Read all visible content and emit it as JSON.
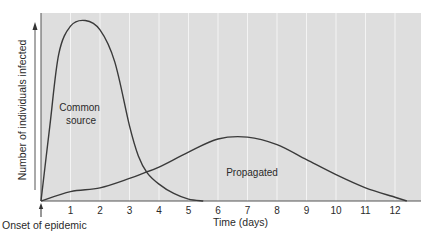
{
  "chart_data": {
    "type": "line",
    "title": "",
    "xlabel": "Time (days)",
    "ylabel": "Number of individuals infected",
    "x_ticks": [
      1,
      2,
      3,
      4,
      5,
      6,
      7,
      8,
      9,
      10,
      11,
      12
    ],
    "xlim": [
      0,
      13
    ],
    "ylim": [
      0,
      100
    ],
    "grid": "vertical",
    "origin_annotation": "Onset of epidemic",
    "series": [
      {
        "name": "Common source",
        "label_lines": [
          "Common",
          "source"
        ],
        "x": [
          0,
          0.3,
          0.6,
          1.0,
          1.5,
          2.0,
          2.5,
          3.0,
          3.3,
          3.6,
          4.0,
          4.5,
          5.0,
          5.5
        ],
        "values": [
          0,
          40,
          78,
          93,
          96,
          91,
          74,
          40,
          24,
          15,
          9,
          4,
          1,
          0
        ]
      },
      {
        "name": "Propagated",
        "label_lines": [
          "Propagated"
        ],
        "x": [
          0,
          1,
          2,
          3,
          3.5,
          4,
          5,
          6,
          7,
          8,
          9,
          10,
          11,
          12,
          12.4
        ],
        "values": [
          0,
          5,
          7,
          12,
          15,
          18,
          26,
          33,
          34,
          30,
          22,
          14,
          7,
          2,
          0
        ]
      }
    ]
  },
  "colors": {
    "plot_background": "#dedede",
    "grid": "#f4f4f4",
    "curve": "#3a3a3a",
    "axis": "#555555"
  }
}
